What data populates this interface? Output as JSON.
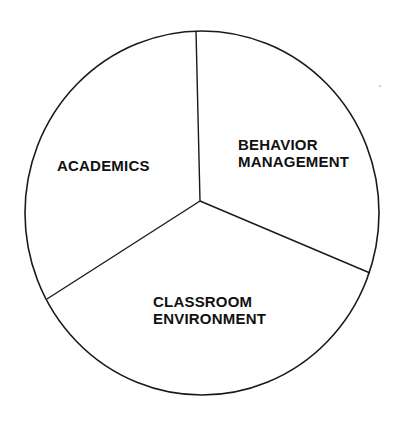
{
  "diagram": {
    "type": "segmented-circle",
    "segments": [
      {
        "label_lines": [
          "ACADEMICS"
        ]
      },
      {
        "label_lines": [
          "BEHAVIOR",
          "MANAGEMENT"
        ]
      },
      {
        "label_lines": [
          "CLASSROOM",
          "ENVIRONMENT"
        ]
      }
    ],
    "colors": {
      "line": "#1a1a1a",
      "fill": "#ffffff",
      "text": "#111111"
    }
  }
}
